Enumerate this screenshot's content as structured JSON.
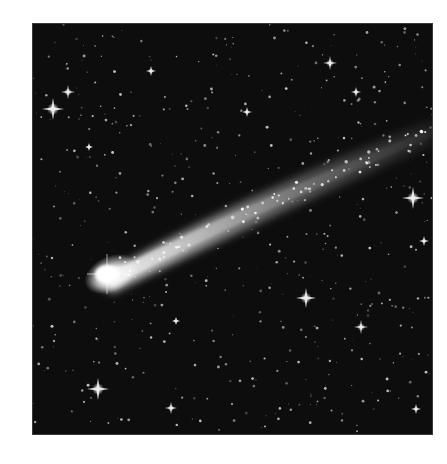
{
  "image": {
    "subject": "comet-with-tail-in-starfield",
    "background": "#ffffff",
    "sky_color": "#0e0d0e",
    "frame": {
      "x": 32,
      "y": 23,
      "width": 401,
      "height": 412
    },
    "comet": {
      "head": {
        "x": 73,
        "y": 247
      },
      "tail_end": {
        "x": 401,
        "y": 102
      },
      "color": "#ffffff"
    },
    "bright_stars": [
      {
        "x": 20,
        "y": 85,
        "r": 11
      },
      {
        "x": 35,
        "y": 68,
        "r": 7
      },
      {
        "x": 297,
        "y": 39,
        "r": 7
      },
      {
        "x": 380,
        "y": 174,
        "r": 11
      },
      {
        "x": 273,
        "y": 274,
        "r": 10
      },
      {
        "x": 65,
        "y": 365,
        "r": 11
      },
      {
        "x": 328,
        "y": 303,
        "r": 7
      },
      {
        "x": 118,
        "y": 47,
        "r": 5
      },
      {
        "x": 138,
        "y": 384,
        "r": 6
      },
      {
        "x": 391,
        "y": 217,
        "r": 5
      },
      {
        "x": 214,
        "y": 88,
        "r": 5
      },
      {
        "x": 323,
        "y": 68,
        "r": 5
      },
      {
        "x": 56,
        "y": 123,
        "r": 4
      },
      {
        "x": 141,
        "y": 422,
        "r": 4
      },
      {
        "x": 383,
        "y": 385,
        "r": 5
      },
      {
        "x": 143,
        "y": 297,
        "r": 4
      }
    ]
  }
}
